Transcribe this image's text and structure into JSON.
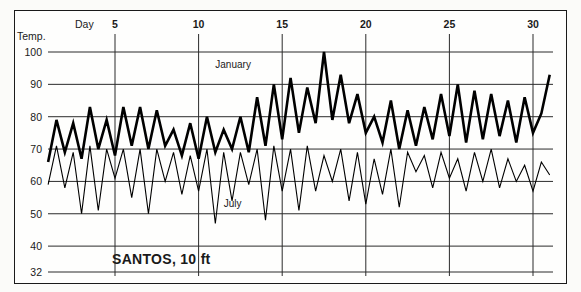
{
  "figure": {
    "station_label": "SANTOS, 10 ft",
    "temp_axis_label": "Temp.",
    "day_axis_label": "Day",
    "series_label_january": "January",
    "series_label_july": "July",
    "frame_color": "#1a1a1a",
    "line_color": "#000000"
  },
  "chart_data": {
    "type": "line",
    "title": "SANTOS, 10 ft",
    "xlabel": "Day",
    "ylabel": "Temp.",
    "xlim": [
      1,
      31
    ],
    "ylim": [
      32,
      104
    ],
    "grid": true,
    "grid_axis": "both",
    "legend": "inline-annotations",
    "ytick_labels": [
      "100",
      "90",
      "80",
      "70",
      "60",
      "50",
      "40",
      "32"
    ],
    "ytick_values": [
      100,
      90,
      80,
      70,
      60,
      50,
      40,
      32
    ],
    "xtick_labels": [
      "5",
      "10",
      "15",
      "20",
      "25",
      "30"
    ],
    "xtick_values": [
      5,
      10,
      15,
      20,
      25,
      30
    ],
    "x": [
      1,
      1.5,
      2,
      2.5,
      3,
      3.5,
      4,
      4.5,
      5,
      5.5,
      6,
      6.5,
      7,
      7.5,
      8,
      8.5,
      9,
      9.5,
      10,
      10.5,
      11,
      11.5,
      12,
      12.5,
      13,
      13.5,
      14,
      14.5,
      15,
      15.5,
      16,
      16.5,
      17,
      17.5,
      18,
      18.5,
      19,
      19.5,
      20,
      20.5,
      21,
      21.5,
      22,
      22.5,
      23,
      23.5,
      24,
      24.5,
      25,
      25.5,
      26,
      26.5,
      27,
      27.5,
      28,
      28.5,
      29,
      29.5,
      30,
      30.5,
      31
    ],
    "series": [
      {
        "name": "January",
        "style": "thick",
        "values": [
          66,
          79,
          69,
          78,
          67,
          83,
          70,
          79,
          68,
          83,
          71,
          83,
          70,
          82,
          71,
          76,
          68,
          78,
          67,
          80,
          69,
          76,
          70,
          80,
          69,
          86,
          71,
          90,
          73,
          92,
          75,
          89,
          78,
          100,
          79,
          93,
          78,
          87,
          75,
          80,
          72,
          85,
          70,
          82,
          71,
          83,
          73,
          87,
          74,
          90,
          72,
          88,
          73,
          87,
          74,
          85,
          72,
          86,
          75,
          81,
          93
        ]
      },
      {
        "name": "July",
        "style": "thin",
        "values": [
          59,
          71,
          58,
          69,
          50,
          71,
          51,
          70,
          61,
          70,
          55,
          70,
          50,
          70,
          60,
          69,
          56,
          68,
          57,
          70,
          47,
          69,
          54,
          69,
          59,
          70,
          48,
          71,
          57,
          70,
          51,
          71,
          57,
          68,
          60,
          70,
          54,
          69,
          53,
          67,
          56,
          70,
          52,
          69,
          63,
          68,
          58,
          69,
          61,
          67,
          57,
          69,
          60,
          70,
          58,
          67,
          60,
          65,
          57,
          66,
          62
        ]
      }
    ],
    "annotations": [
      {
        "text": "January",
        "x": 11.0,
        "y": 95
      },
      {
        "text": "July",
        "x": 11.5,
        "y": 52
      }
    ]
  }
}
